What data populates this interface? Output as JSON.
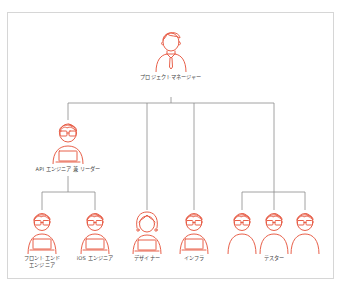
{
  "diagram": {
    "type": "org-chart",
    "stroke_color": "#e8604a",
    "line_color": "#8a8a8a",
    "frame_color": "#d6d6d6",
    "root": {
      "label": "プロジェクトマネージャー",
      "icon": "manager-person-icon"
    },
    "leader": {
      "label": "API エンジニア 兼 リーダー",
      "icon": "engineer-with-laptop-icon"
    },
    "team": [
      {
        "label_line1": "フロントエンド",
        "label_line2": "エンジニア",
        "icon": "engineer-with-laptop-icon",
        "reports_to": "leader"
      },
      {
        "label_line1": "iOS エンジニア",
        "label_line2": "",
        "icon": "engineer-with-laptop-icon",
        "reports_to": "leader"
      },
      {
        "label_line1": "デザイナー",
        "label_line2": "",
        "icon": "designer-with-laptop-icon",
        "reports_to": "root"
      },
      {
        "label_line1": "インフラ",
        "label_line2": "",
        "icon": "engineer-with-laptop-icon",
        "reports_to": "root"
      }
    ],
    "testers": {
      "label": "テスター",
      "count": 3,
      "icon": "tester-person-icon",
      "reports_to": "root"
    }
  }
}
